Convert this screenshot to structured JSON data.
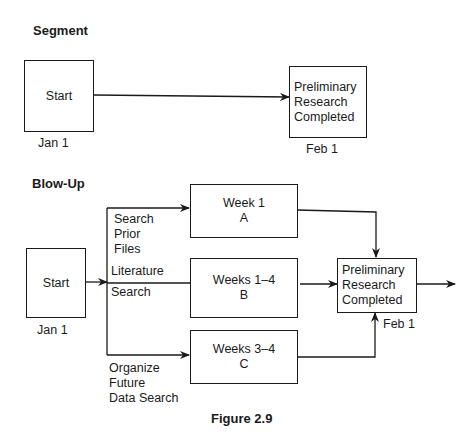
{
  "segment": {
    "title": "Segment",
    "start_box": {
      "label": "Start",
      "date": "Jan 1"
    },
    "end_box": {
      "label": "Preliminary\nResearch\nCompleted",
      "date": "Feb 1"
    }
  },
  "blowup": {
    "title": "Blow-Up",
    "start_box": {
      "label": "Start",
      "date": "Jan 1"
    },
    "branches": [
      {
        "path_label": "Search\nPrior\nFiles",
        "box_line1": "Week 1",
        "box_line2": "A"
      },
      {
        "path_label_top": "Literature",
        "path_label_bottom": "Search",
        "box_line1": "Weeks 1–4",
        "box_line2": "B"
      },
      {
        "path_label": "Organize\nFuture\nData Search",
        "box_line1": "Weeks 3–4",
        "box_line2": "C"
      }
    ],
    "end_box": {
      "label": "Preliminary\nResearch\nCompleted",
      "date": "Feb 1"
    }
  },
  "caption": "Figure 2.9",
  "colors": {
    "line": "#1a1a1a",
    "background": "#ffffff"
  }
}
